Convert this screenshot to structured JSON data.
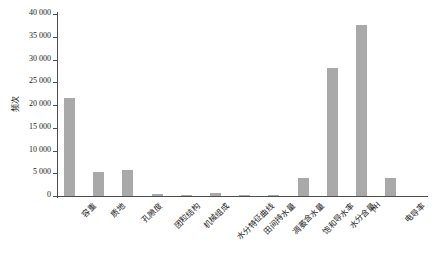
{
  "chart_data": {
    "type": "bar",
    "title": "",
    "xlabel": "",
    "ylabel": "频次",
    "ylim": [
      0,
      40000
    ],
    "grid": false,
    "legend": null,
    "bar_color": "#a9a9a9",
    "axis_color": "#4d4d4d",
    "ytick_labels": [
      "0",
      "5 000",
      "10 000",
      "15 000",
      "20 000",
      "25 000",
      "30 000",
      "35 000",
      "40 000"
    ],
    "ytick_values": [
      0,
      5000,
      10000,
      15000,
      20000,
      25000,
      30000,
      35000,
      40000
    ],
    "categories": [
      "容重",
      "质地",
      "孔隙度",
      "团粒结构",
      "机械组成",
      "水分特征曲线",
      "田间持水量",
      "凋萎含水量",
      "饱和导水率",
      "水分含量",
      "pH",
      "电导率"
    ],
    "values": [
      21500,
      5200,
      5700,
      450,
      300,
      600,
      150,
      120,
      3900,
      28100,
      37600,
      4000
    ]
  }
}
